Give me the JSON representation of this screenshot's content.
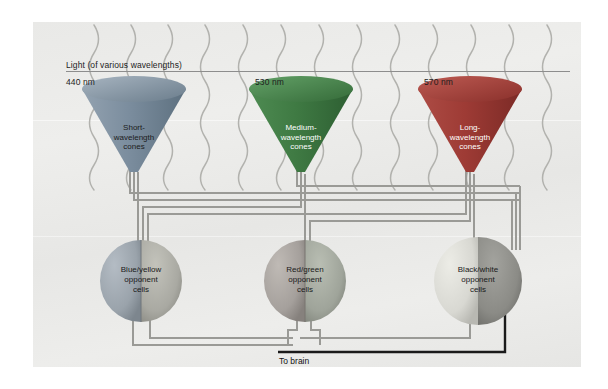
{
  "diagram": {
    "title_label": "Light (of various wavelengths)",
    "output_label": "To brain",
    "wavelengths": [
      {
        "id": "short",
        "value": "440 nm"
      },
      {
        "id": "medium",
        "value": "530 nm"
      },
      {
        "id": "long",
        "value": "570 nm"
      }
    ],
    "cones": [
      {
        "id": "short-wavelength-cone",
        "line1": "Short-",
        "line2": "wavelength",
        "line3": "cones",
        "wavelength": "440 nm",
        "color": "#7b8d9e",
        "text_style": "dark"
      },
      {
        "id": "medium-wavelength-cone",
        "line1": "Medium-",
        "line2": "wavelength",
        "line3": "cones",
        "wavelength": "530 nm",
        "color": "#3f7a43",
        "text_style": "light"
      },
      {
        "id": "long-wavelength-cone",
        "line1": "Long-",
        "line2": "wavelength",
        "line3": "cones",
        "wavelength": "570 nm",
        "color": "#9e3b35",
        "text_style": "light"
      }
    ],
    "opponent_cells": [
      {
        "id": "blue-yellow-opponent-cells",
        "line1": "Blue/yellow",
        "line2": "opponent",
        "line3": "cells",
        "left_color": "#9aa3ab",
        "right_color": "#a9a9a2"
      },
      {
        "id": "red-green-opponent-cells",
        "line1": "Red/green",
        "line2": "opponent",
        "line3": "cells",
        "left_color": "#a5a09c",
        "right_color": "#9fa49a"
      },
      {
        "id": "black-white-opponent-cells",
        "line1": "Black/white",
        "line2": "opponent",
        "line3": "cells",
        "left_color": "#d8d8d2",
        "right_color": "#8b8b86"
      }
    ],
    "colors": {
      "panel_background": "#ebebe9",
      "wire": "#9a9a96",
      "wire_dark": "#7d7d79",
      "brain_wire": "#1a1a1a",
      "ray": "#b0b0ac",
      "rule": "#8d8d8d",
      "text": "#1d1d1d"
    }
  }
}
